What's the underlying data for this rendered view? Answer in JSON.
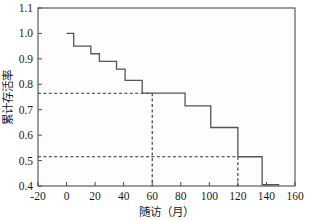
{
  "chart_data": {
    "type": "line",
    "subtype": "kaplan-meier-step",
    "title": "",
    "xlabel": "随访（月）",
    "ylabel": "累计存活率",
    "xlim": [
      -20,
      160
    ],
    "ylim": [
      0.4,
      1.1
    ],
    "xticks": [
      -20,
      0,
      20,
      40,
      60,
      80,
      100,
      120,
      140,
      160
    ],
    "xtick_labels": [
      "-20",
      "0",
      "20",
      "40",
      "60",
      "80",
      "100",
      "120",
      "140",
      "160"
    ],
    "yticks": [
      0.4,
      0.5,
      0.6,
      0.7,
      0.8,
      0.9,
      1.0,
      1.1
    ],
    "ytick_labels": [
      "0.4",
      "0.5",
      "0.6",
      "0.7",
      "0.8",
      "0.9",
      "1.0",
      "1.1"
    ],
    "grid": false,
    "legend": "none",
    "series": [
      {
        "name": "累计存活率",
        "step": "post",
        "x": [
          0,
          5,
          17,
          23,
          35,
          41,
          53,
          83,
          101,
          120,
          137,
          149
        ],
        "y": [
          1.0,
          0.95,
          0.92,
          0.89,
          0.86,
          0.815,
          0.765,
          0.715,
          0.63,
          0.515,
          0.405,
          0.405
        ]
      }
    ],
    "annotations": [
      {
        "name": "median-reference-5yr",
        "type": "reference-lines",
        "x": 60,
        "y": 0.765,
        "style": "dashed",
        "description": "60个月处累计存活率约0.77"
      },
      {
        "name": "median-reference-10yr",
        "type": "reference-lines",
        "x": 120,
        "y": 0.515,
        "style": "dashed",
        "description": "120个月处累计存活率约0.52"
      }
    ],
    "colors": {
      "curve": "#555555",
      "reference": "#303030",
      "frame": "#4d4d4d",
      "background": "#fdfdfd"
    }
  }
}
